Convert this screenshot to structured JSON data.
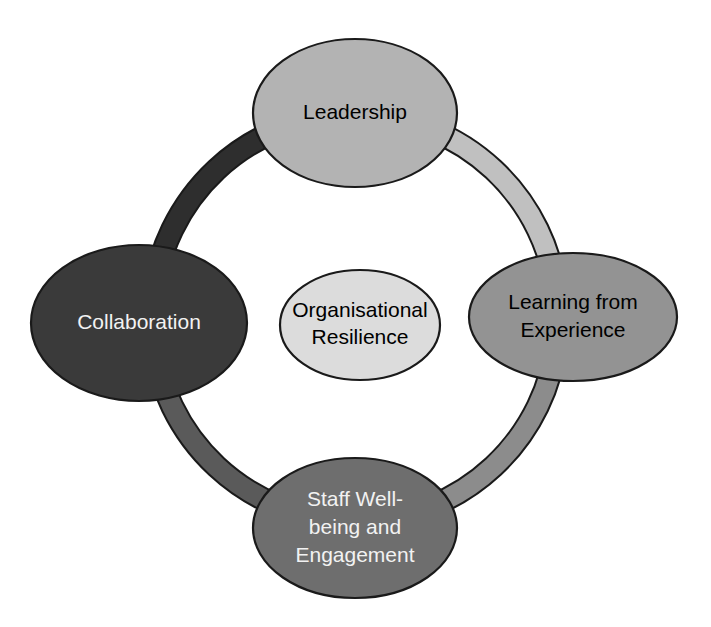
{
  "diagram": {
    "type": "cycle-diagram",
    "center": {
      "id": "organisational-resilience",
      "lines": [
        "Organisational",
        "Resilience"
      ],
      "fill": "#dcdcdc",
      "text_color": "#000000",
      "cx": 360,
      "cy": 325,
      "rx": 80,
      "ry": 55
    },
    "nodes": [
      {
        "id": "leadership",
        "position": "top",
        "lines": [
          "Leadership"
        ],
        "fill": "#b3b3b3",
        "text_color": "#000000",
        "cx": 355,
        "cy": 113,
        "rx": 102,
        "ry": 74
      },
      {
        "id": "learning-from-experience",
        "position": "right",
        "lines": [
          "Learning from",
          "Experience"
        ],
        "fill": "#939393",
        "text_color": "#000000",
        "cx": 573,
        "cy": 317,
        "rx": 104,
        "ry": 64
      },
      {
        "id": "staff-wellbeing-and-engagement",
        "position": "bottom",
        "lines": [
          "Staff Well-",
          "being and",
          "Engagement"
        ],
        "fill": "#6e6e6e",
        "text_color": "#f2f2f2",
        "cx": 355,
        "cy": 528,
        "rx": 102,
        "ry": 70
      },
      {
        "id": "collaboration",
        "position": "left",
        "lines": [
          "Collaboration"
        ],
        "fill": "#3a3a3a",
        "text_color": "#f2f2f2",
        "cx": 139,
        "cy": 323,
        "rx": 108,
        "ry": 78
      }
    ],
    "ring": {
      "cx": 355,
      "cy": 318,
      "radius": 203,
      "stroke_width": 20,
      "outline_color": "#1a1a1a",
      "segments": [
        {
          "id": "segment-collaboration-to-leadership",
          "from": "collaboration",
          "to": "leadership",
          "fill": "#2e2e2e",
          "start_angle": 186,
          "end_angle": 268
        },
        {
          "id": "segment-leadership-to-learning",
          "from": "leadership",
          "to": "learning-from-experience",
          "fill": "#c0c0c0",
          "start_angle": 272,
          "end_angle": 354
        },
        {
          "id": "segment-learning-to-staff-wellbeing",
          "from": "learning-from-experience",
          "to": "staff-wellbeing-and-engagement",
          "fill": "#8c8c8c",
          "start_angle": 6,
          "end_angle": 88
        },
        {
          "id": "segment-staff-wellbeing-to-collaboration",
          "from": "staff-wellbeing-and-engagement",
          "to": "collaboration",
          "fill": "#5a5a5a",
          "start_angle": 92,
          "end_angle": 174
        }
      ]
    }
  }
}
